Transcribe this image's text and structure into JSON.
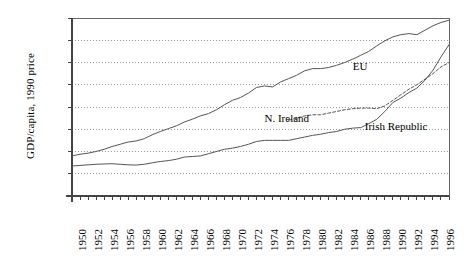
{
  "chart_data": {
    "type": "line",
    "title": "",
    "xlabel": "",
    "ylabel": "GDP/capita, 1990 price",
    "xlim": [
      1950,
      1997
    ],
    "ylim": [
      0,
      16000
    ],
    "grid": true,
    "grid_axis": "y",
    "legend_position": "inline-annotations",
    "yticks": [
      "0",
      "2,000",
      "4,000",
      "6,000",
      "8,000",
      "10,000",
      "12,000",
      "14,000",
      "16,000"
    ],
    "ytick_values": [
      0,
      2000,
      4000,
      6000,
      8000,
      10000,
      12000,
      14000,
      16000
    ],
    "xticks": [
      "1950",
      "1952",
      "1954",
      "1956",
      "1958",
      "1960",
      "1962",
      "1964",
      "1966",
      "1968",
      "1970",
      "1972",
      "1974",
      "1976",
      "1978",
      "1980",
      "1982",
      "1984",
      "1986",
      "1988",
      "1990",
      "1992",
      "1994",
      "1996"
    ],
    "xtick_values": [
      1950,
      1952,
      1954,
      1956,
      1958,
      1960,
      1962,
      1964,
      1966,
      1968,
      1970,
      1972,
      1974,
      1976,
      1978,
      1980,
      1982,
      1984,
      1986,
      1988,
      1990,
      1992,
      1994,
      1996
    ],
    "annotations": [
      {
        "text": "EU",
        "x": 1985,
        "y": 11600
      },
      {
        "text": "N. Ireland",
        "x": 1974,
        "y": 6900
      },
      {
        "text": "Irish Republic",
        "x": 1986.5,
        "y": 6200
      }
    ],
    "series": [
      {
        "name": "EU",
        "style": "solid",
        "color": "#555555",
        "x": [
          1950,
          1951,
          1952,
          1953,
          1954,
          1955,
          1956,
          1957,
          1958,
          1959,
          1960,
          1961,
          1962,
          1963,
          1964,
          1965,
          1966,
          1967,
          1968,
          1969,
          1970,
          1971,
          1972,
          1973,
          1974,
          1975,
          1976,
          1977,
          1978,
          1979,
          1980,
          1981,
          1982,
          1983,
          1984,
          1985,
          1986,
          1987,
          1988,
          1989,
          1990,
          1991,
          1992,
          1993,
          1994,
          1995,
          1996,
          1997
        ],
        "values": [
          3600,
          3750,
          3850,
          4000,
          4200,
          4450,
          4650,
          4850,
          4950,
          5150,
          5500,
          5800,
          6050,
          6300,
          6650,
          6900,
          7200,
          7400,
          7750,
          8200,
          8600,
          8850,
          9250,
          9750,
          9900,
          9800,
          10250,
          10550,
          10850,
          11250,
          11450,
          11450,
          11550,
          11750,
          12000,
          12300,
          12650,
          13000,
          13500,
          13950,
          14300,
          14500,
          14600,
          14500,
          14900,
          15300,
          15600,
          15800
        ]
      },
      {
        "name": "N. Ireland",
        "style": "dashed",
        "color": "#555555",
        "x": [
          1977,
          1978,
          1979,
          1980,
          1981,
          1982,
          1983,
          1984,
          1985,
          1986,
          1987,
          1988,
          1989,
          1990,
          1991,
          1992,
          1993,
          1994,
          1995,
          1996,
          1997
        ],
        "values": [
          6800,
          7000,
          7200,
          7300,
          7300,
          7450,
          7600,
          7750,
          7850,
          7900,
          7900,
          7850,
          8100,
          8600,
          9100,
          9600,
          10000,
          10500,
          11000,
          11600,
          12000
        ]
      },
      {
        "name": "Irish Republic",
        "style": "solid",
        "color": "#555555",
        "x": [
          1950,
          1951,
          1952,
          1953,
          1954,
          1955,
          1956,
          1957,
          1958,
          1959,
          1960,
          1961,
          1962,
          1963,
          1964,
          1965,
          1966,
          1967,
          1968,
          1969,
          1970,
          1971,
          1972,
          1973,
          1974,
          1975,
          1976,
          1977,
          1978,
          1979,
          1980,
          1981,
          1982,
          1983,
          1984,
          1985,
          1986,
          1987,
          1988,
          1989,
          1990,
          1991,
          1992,
          1993,
          1994,
          1995,
          1996,
          1997
        ],
        "values": [
          2700,
          2750,
          2800,
          2850,
          2880,
          2900,
          2850,
          2800,
          2780,
          2850,
          2980,
          3100,
          3180,
          3300,
          3500,
          3550,
          3600,
          3800,
          4000,
          4200,
          4300,
          4450,
          4650,
          4900,
          5000,
          5000,
          5000,
          5000,
          5150,
          5300,
          5450,
          5550,
          5700,
          5800,
          6000,
          6100,
          6150,
          6500,
          6900,
          7600,
          8400,
          8800,
          9300,
          9700,
          10400,
          11300,
          12500,
          13600
        ]
      }
    ]
  },
  "axis": {
    "y_axis_line": "solid",
    "plot_border": "solid",
    "gridline_style": "dotted",
    "gridline_color": "#999999"
  }
}
